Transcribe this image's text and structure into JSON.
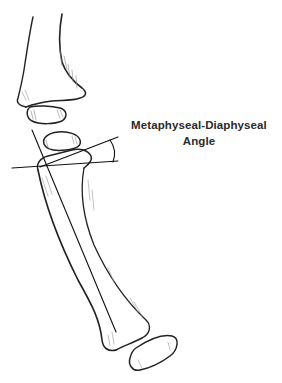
{
  "figure": {
    "type": "anatomical line drawing",
    "annotation": {
      "line1": "Metaphyseal-Diaphyseal",
      "line2": "Angle"
    },
    "colors": {
      "ink": "#222222",
      "background": "#ffffff"
    }
  }
}
